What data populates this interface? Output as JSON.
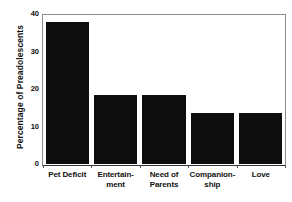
{
  "chart_data": {
    "type": "bar",
    "title": "",
    "subtitle": "",
    "xlabel": "",
    "ylabel": "Percentage of Preadolescents",
    "categories": [
      "Pet Deficit",
      "Entertainment",
      "Need of Parents",
      "Companionship",
      "Love"
    ],
    "category_lines": [
      [
        "Pet Deficit",
        ""
      ],
      [
        "Entertain-",
        "ment"
      ],
      [
        "Need of",
        "Parents"
      ],
      [
        "Companion-",
        "ship"
      ],
      [
        "Love",
        ""
      ]
    ],
    "values": [
      38,
      18.5,
      18.5,
      13.7,
      13.7
    ],
    "ylim": [
      0,
      40
    ],
    "ytick_labels": [
      "0",
      "10",
      "20",
      "30",
      "40"
    ],
    "ytick_values": [
      0,
      10,
      20,
      30,
      40
    ],
    "yminor_values": [
      2.5,
      5,
      7.5,
      12.5,
      15,
      17.5,
      22.5,
      25,
      27.5,
      32.5,
      35,
      37.5
    ],
    "grid": false,
    "legend": "none",
    "bar_color": "#0d0d0d",
    "frame_color": "#8a8a8a",
    "axis_color": "#333333",
    "background": "#ffffff"
  }
}
